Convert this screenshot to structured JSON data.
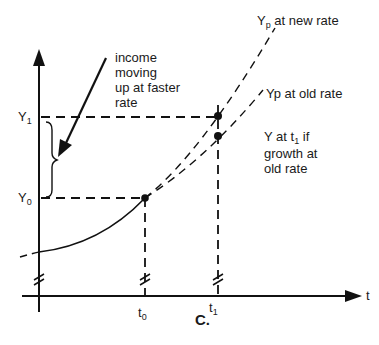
{
  "axes": {
    "y_label_Y1": "Y",
    "y_label_Y1_sub": "1",
    "y_label_Y0": "Y",
    "y_label_Y0_sub": "0",
    "x_label_t": "t",
    "x_label_t0": "t",
    "x_label_t0_sub": "0",
    "x_label_t1": "t",
    "x_label_t1_sub": "1"
  },
  "annotations": {
    "income_moving": [
      "income",
      "moving",
      "up at faster",
      "rate"
    ],
    "yp_new_rate": {
      "main": "Y",
      "sub": "p",
      "rest": " at new rate"
    },
    "yp_old_rate": "Yp at old rate",
    "y_at_t1": {
      "line1_main": "Y at t",
      "line1_sub": "1",
      "line1_rest": " if",
      "line2": "growth at",
      "line3": "old rate"
    }
  },
  "panel_label": "C."
}
